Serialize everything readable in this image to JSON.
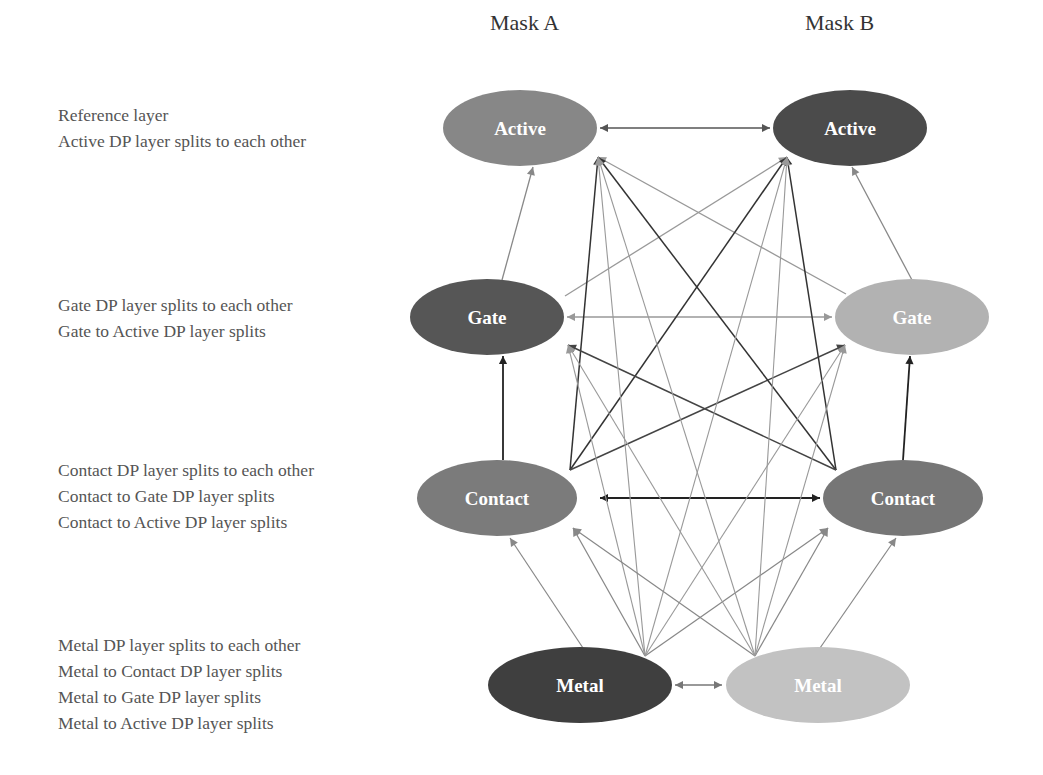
{
  "columns": [
    {
      "label": "Mask A",
      "x": 490
    },
    {
      "label": "Mask B",
      "x": 805
    }
  ],
  "rows": [
    {
      "top": 102,
      "lines": [
        "Reference layer",
        "Active DP layer splits to each other"
      ]
    },
    {
      "top": 292,
      "lines": [
        "Gate DP layer splits to each other",
        "Gate to Active DP layer splits"
      ]
    },
    {
      "top": 457,
      "lines": [
        "Contact DP layer splits to each other",
        "Contact to Gate DP layer splits",
        "Contact to Active DP layer splits"
      ]
    },
    {
      "top": 632,
      "lines": [
        "Metal DP layer splits to each other",
        "Metal to Contact DP layer splits",
        "Metal to Gate DP layer splits",
        "Metal to Active DP layer splits"
      ]
    }
  ],
  "nodes": {
    "activeA": {
      "label": "Active",
      "mask": "A",
      "cx": 520,
      "cy": 128,
      "rx": 77,
      "ry": 38,
      "color": "#878787"
    },
    "activeB": {
      "label": "Active",
      "mask": "B",
      "cx": 850,
      "cy": 128,
      "rx": 77,
      "ry": 38,
      "color": "#4b4b4b"
    },
    "gateA": {
      "label": "Gate",
      "mask": "A",
      "cx": 487,
      "cy": 317,
      "rx": 77,
      "ry": 38,
      "color": "#565656"
    },
    "gateB": {
      "label": "Gate",
      "mask": "B",
      "cx": 912,
      "cy": 317,
      "rx": 77,
      "ry": 38,
      "color": "#b2b2b2"
    },
    "contactA": {
      "label": "Contact",
      "mask": "A",
      "cx": 497,
      "cy": 498,
      "rx": 80,
      "ry": 38,
      "color": "#7b7b7b"
    },
    "contactB": {
      "label": "Contact",
      "mask": "B",
      "cx": 903,
      "cy": 498,
      "rx": 80,
      "ry": 38,
      "color": "#767676"
    },
    "metalA": {
      "label": "Metal",
      "mask": "A",
      "cx": 580,
      "cy": 685,
      "rx": 92,
      "ry": 38,
      "color": "#3f3f3f"
    },
    "metalB": {
      "label": "Metal",
      "mask": "B",
      "cx": 818,
      "cy": 685,
      "rx": 92,
      "ry": 38,
      "color": "#c2c2c2"
    }
  },
  "edges": [
    {
      "x1": 600,
      "y1": 128,
      "x2": 770,
      "y2": 128,
      "both": true,
      "color": "#555",
      "w": 1.6
    },
    {
      "x1": 567,
      "y1": 317,
      "x2": 832,
      "y2": 317,
      "both": true,
      "color": "#999",
      "w": 1.6
    },
    {
      "x1": 600,
      "y1": 498,
      "x2": 820,
      "y2": 498,
      "both": true,
      "color": "#222",
      "w": 2.2
    },
    {
      "x1": 675,
      "y1": 685,
      "x2": 722,
      "y2": 685,
      "both": true,
      "color": "#777",
      "w": 1.6
    },
    {
      "x1": 502,
      "y1": 280,
      "x2": 533,
      "y2": 167,
      "color": "#888",
      "w": 1.3
    },
    {
      "x1": 912,
      "y1": 280,
      "x2": 852,
      "y2": 167,
      "color": "#888",
      "w": 1.3
    },
    {
      "x1": 565,
      "y1": 296,
      "x2": 787,
      "y2": 157,
      "color": "#999",
      "w": 1.3
    },
    {
      "x1": 846,
      "y1": 294,
      "x2": 598,
      "y2": 157,
      "color": "#999",
      "w": 1.3
    },
    {
      "x1": 503,
      "y1": 460,
      "x2": 503,
      "y2": 356,
      "color": "#222",
      "w": 1.8
    },
    {
      "x1": 903,
      "y1": 460,
      "x2": 910,
      "y2": 356,
      "color": "#222",
      "w": 1.8
    },
    {
      "x1": 570,
      "y1": 470,
      "x2": 598,
      "y2": 157,
      "color": "#333",
      "w": 1.5
    },
    {
      "x1": 570,
      "y1": 470,
      "x2": 787,
      "y2": 157,
      "color": "#333",
      "w": 1.5
    },
    {
      "x1": 570,
      "y1": 470,
      "x2": 845,
      "y2": 345,
      "color": "#444",
      "w": 1.5
    },
    {
      "x1": 836,
      "y1": 470,
      "x2": 787,
      "y2": 157,
      "color": "#333",
      "w": 1.5
    },
    {
      "x1": 836,
      "y1": 470,
      "x2": 598,
      "y2": 157,
      "color": "#333",
      "w": 1.5
    },
    {
      "x1": 836,
      "y1": 470,
      "x2": 568,
      "y2": 345,
      "color": "#444",
      "w": 1.5
    },
    {
      "x1": 583,
      "y1": 648,
      "x2": 510,
      "y2": 538,
      "color": "#888",
      "w": 1.2
    },
    {
      "x1": 645,
      "y1": 656,
      "x2": 573,
      "y2": 528,
      "color": "#888",
      "w": 1.2
    },
    {
      "x1": 645,
      "y1": 656,
      "x2": 828,
      "y2": 528,
      "color": "#888",
      "w": 1.2
    },
    {
      "x1": 645,
      "y1": 656,
      "x2": 568,
      "y2": 345,
      "color": "#999",
      "w": 1.1
    },
    {
      "x1": 645,
      "y1": 656,
      "x2": 845,
      "y2": 345,
      "color": "#999",
      "w": 1.1
    },
    {
      "x1": 645,
      "y1": 656,
      "x2": 598,
      "y2": 157,
      "color": "#999",
      "w": 1.1
    },
    {
      "x1": 645,
      "y1": 656,
      "x2": 787,
      "y2": 157,
      "color": "#999",
      "w": 1.1
    },
    {
      "x1": 755,
      "y1": 656,
      "x2": 573,
      "y2": 528,
      "color": "#888",
      "w": 1.2
    },
    {
      "x1": 755,
      "y1": 656,
      "x2": 828,
      "y2": 528,
      "color": "#888",
      "w": 1.2
    },
    {
      "x1": 755,
      "y1": 656,
      "x2": 568,
      "y2": 345,
      "color": "#999",
      "w": 1.1
    },
    {
      "x1": 755,
      "y1": 656,
      "x2": 845,
      "y2": 345,
      "color": "#999",
      "w": 1.1
    },
    {
      "x1": 755,
      "y1": 656,
      "x2": 598,
      "y2": 157,
      "color": "#999",
      "w": 1.1
    },
    {
      "x1": 755,
      "y1": 656,
      "x2": 787,
      "y2": 157,
      "color": "#999",
      "w": 1.1
    },
    {
      "x1": 820,
      "y1": 648,
      "x2": 896,
      "y2": 538,
      "color": "#888",
      "w": 1.2
    }
  ]
}
